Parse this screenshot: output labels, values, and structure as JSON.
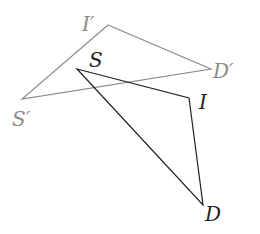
{
  "diagram": {
    "type": "triangle-transformation",
    "colors": {
      "original": "#222222",
      "image": "#8a8a8a",
      "background": "#ffffff"
    },
    "original_triangle": {
      "vertices": [
        {
          "label": "S",
          "x": 77,
          "y": 69
        },
        {
          "label": "I",
          "x": 189,
          "y": 98
        },
        {
          "label": "D",
          "x": 203,
          "y": 205
        }
      ]
    },
    "image_triangle": {
      "vertices": [
        {
          "label": "I′",
          "x": 108,
          "y": 25
        },
        {
          "label": "D′",
          "x": 211,
          "y": 69
        },
        {
          "label": "S′",
          "x": 22,
          "y": 99
        }
      ]
    },
    "labels": {
      "S": "S",
      "I": "I",
      "D": "D",
      "Sp": "S′",
      "Ip": "I′",
      "Dp": "D′"
    }
  }
}
